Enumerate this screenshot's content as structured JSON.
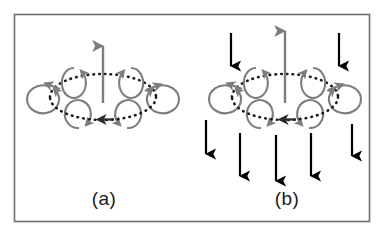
{
  "figure": {
    "background_color": "#ffffff",
    "border_color": "#6e6e6e",
    "border": {
      "x": 14,
      "y": 14,
      "width": 356,
      "height": 208
    }
  },
  "colors": {
    "vortex_gray": "#7d7d7d",
    "torus_dotted": "#1a1a1a",
    "downdraft_black": "#000000",
    "updraft_gray": "#7d7d7d",
    "label_text": "#1a1a1a"
  },
  "panels": [
    {
      "id": "panel-a",
      "label": "(a)",
      "label_position": {
        "x": 104,
        "y": 205
      },
      "center": {
        "x": 103,
        "y": 97
      },
      "torus": {
        "shape": "ellipse",
        "cx": 103,
        "cy": 97,
        "rx": 53,
        "ry": 23,
        "stroke_style": "dotted",
        "circulation_arrows": [
          {
            "name": "torus-arrow-left",
            "x": 51,
            "y": 87,
            "direction": "up-left"
          },
          {
            "name": "torus-arrow-right",
            "x": 155,
            "y": 86,
            "direction": "up-right"
          },
          {
            "name": "torus-arrow-bottom",
            "x": 101,
            "y": 119,
            "direction": "left"
          }
        ]
      },
      "eddies": [
        {
          "name": "eddy-top-left",
          "cx": 74,
          "cy": 83,
          "rx": 12,
          "ry": 15,
          "spin": "counterclockwise"
        },
        {
          "name": "eddy-top-right",
          "cx": 131,
          "cy": 83,
          "rx": 12,
          "ry": 15,
          "spin": "clockwise"
        },
        {
          "name": "eddy-mid-left",
          "cx": 44,
          "cy": 99,
          "rx": 16,
          "ry": 14,
          "spin": "counterclockwise"
        },
        {
          "name": "eddy-mid-right",
          "cx": 162,
          "cy": 99,
          "rx": 16,
          "ry": 14,
          "spin": "clockwise"
        },
        {
          "name": "eddy-bottom-left",
          "cx": 79,
          "cy": 114,
          "rx": 13,
          "ry": 14,
          "spin": "counterclockwise"
        },
        {
          "name": "eddy-bottom-right",
          "cx": 127,
          "cy": 114,
          "rx": 13,
          "ry": 14,
          "spin": "clockwise"
        }
      ],
      "updraft": {
        "name": "updraft-arrow",
        "x": 103,
        "y_tail": 103,
        "y_head": 44,
        "direction": "up",
        "color": "#7d7d7d"
      },
      "downdrafts": []
    },
    {
      "id": "panel-b",
      "label": "(b)",
      "label_position": {
        "x": 287,
        "y": 205
      },
      "center": {
        "x": 285,
        "y": 97
      },
      "torus": {
        "shape": "ellipse",
        "cx": 285,
        "cy": 97,
        "rx": 53,
        "ry": 23,
        "stroke_style": "dotted",
        "circulation_arrows": [
          {
            "name": "torus-arrow-left",
            "x": 233,
            "y": 87,
            "direction": "up-left"
          },
          {
            "name": "torus-arrow-right",
            "x": 337,
            "y": 86,
            "direction": "up-right"
          },
          {
            "name": "torus-arrow-bottom",
            "x": 283,
            "y": 119,
            "direction": "left"
          }
        ]
      },
      "eddies": [
        {
          "name": "eddy-top-left",
          "cx": 256,
          "cy": 83,
          "rx": 12,
          "ry": 15,
          "spin": "counterclockwise"
        },
        {
          "name": "eddy-top-right",
          "cx": 313,
          "cy": 83,
          "rx": 12,
          "ry": 15,
          "spin": "clockwise"
        },
        {
          "name": "eddy-mid-left",
          "cx": 226,
          "cy": 99,
          "rx": 16,
          "ry": 14,
          "spin": "counterclockwise"
        },
        {
          "name": "eddy-mid-right",
          "cx": 344,
          "cy": 99,
          "rx": 16,
          "ry": 14,
          "spin": "clockwise"
        },
        {
          "name": "eddy-bottom-left",
          "cx": 261,
          "cy": 114,
          "rx": 13,
          "ry": 14,
          "spin": "counterclockwise"
        },
        {
          "name": "eddy-bottom-right",
          "cx": 309,
          "cy": 114,
          "rx": 13,
          "ry": 14,
          "spin": "clockwise"
        }
      ],
      "updraft": {
        "name": "updraft-arrow",
        "x": 285,
        "y_tail": 103,
        "y_head": 29,
        "direction": "up",
        "color": "#7d7d7d"
      },
      "downdrafts": [
        {
          "name": "downdraft-top-left",
          "x": 231,
          "y_tail": 33,
          "y_head": 70
        },
        {
          "name": "downdraft-top-right",
          "x": 339,
          "y_tail": 33,
          "y_head": 70
        },
        {
          "name": "downdraft-bottom-1",
          "x": 206,
          "y_tail": 120,
          "y_head": 158
        },
        {
          "name": "downdraft-bottom-2",
          "x": 240,
          "y_tail": 133,
          "y_head": 180
        },
        {
          "name": "downdraft-bottom-3",
          "x": 276,
          "y_tail": 135,
          "y_head": 185
        },
        {
          "name": "downdraft-bottom-4",
          "x": 311,
          "y_tail": 133,
          "y_head": 180
        },
        {
          "name": "downdraft-bottom-5",
          "x": 352,
          "y_tail": 124,
          "y_head": 160
        }
      ]
    }
  ]
}
